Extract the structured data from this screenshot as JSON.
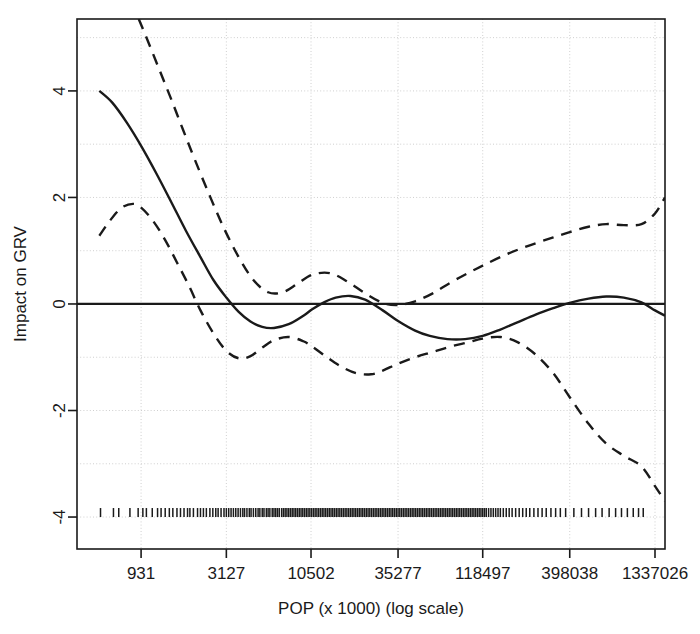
{
  "chart_data": {
    "type": "line",
    "title": "",
    "subtitle": "",
    "xlabel": "POP (x 1000) (log scale)",
    "ylabel": "Impact on GRV",
    "xscale": "log",
    "grid": true,
    "legend": "none",
    "xlim": [
      0,
      1
    ],
    "ylim": [
      -4.6,
      5.35
    ],
    "x_tick_labels": [
      "931",
      "3127",
      "10502",
      "35277",
      "118497",
      "398038",
      "1337026"
    ],
    "x_tick_positions": [
      0.109,
      0.254,
      0.398,
      0.546,
      0.69,
      0.838,
      0.983
    ],
    "y_tick_labels": [
      "4",
      "2",
      "0",
      "-2",
      "-4"
    ],
    "y_tick_values": [
      4,
      2,
      0,
      -2,
      -4
    ],
    "zero_line": 0,
    "series": [
      {
        "name": "fitted smooth",
        "style": "solid",
        "color": "#1a1a1a",
        "x": [
          0.038,
          0.06,
          0.085,
          0.11,
          0.135,
          0.16,
          0.185,
          0.21,
          0.232,
          0.254,
          0.275,
          0.295,
          0.315,
          0.335,
          0.36,
          0.385,
          0.4,
          0.42,
          0.44,
          0.465,
          0.49,
          0.52,
          0.546,
          0.575,
          0.6,
          0.63,
          0.66,
          0.69,
          0.72,
          0.75,
          0.78,
          0.81,
          0.838,
          0.87,
          0.9,
          0.93,
          0.96,
          0.983,
          1.0
        ],
        "y": [
          4.0,
          3.78,
          3.4,
          2.95,
          2.45,
          1.92,
          1.38,
          0.88,
          0.45,
          0.12,
          -0.15,
          -0.33,
          -0.43,
          -0.45,
          -0.38,
          -0.22,
          -0.1,
          0.03,
          0.12,
          0.15,
          0.08,
          -0.12,
          -0.32,
          -0.5,
          -0.6,
          -0.66,
          -0.66,
          -0.6,
          -0.48,
          -0.34,
          -0.2,
          -0.08,
          0.02,
          0.1,
          0.14,
          0.12,
          0.03,
          -0.12,
          -0.22
        ]
      },
      {
        "name": "upper confidence band",
        "style": "dashed",
        "color": "#1a1a1a",
        "x": [
          0.105,
          0.12,
          0.14,
          0.16,
          0.18,
          0.2,
          0.225,
          0.25,
          0.275,
          0.3,
          0.325,
          0.35,
          0.375,
          0.4,
          0.43,
          0.46,
          0.49,
          0.52,
          0.546,
          0.575,
          0.605,
          0.635,
          0.665,
          0.69,
          0.72,
          0.75,
          0.78,
          0.81,
          0.838,
          0.87,
          0.9,
          0.93,
          0.96,
          0.983,
          1.0
        ],
        "y": [
          5.35,
          4.95,
          4.4,
          3.85,
          3.28,
          2.72,
          2.05,
          1.42,
          0.88,
          0.45,
          0.22,
          0.22,
          0.38,
          0.55,
          0.58,
          0.42,
          0.2,
          0.02,
          -0.02,
          0.05,
          0.2,
          0.4,
          0.58,
          0.72,
          0.88,
          1.02,
          1.14,
          1.25,
          1.35,
          1.45,
          1.5,
          1.48,
          1.5,
          1.7,
          2.0
        ]
      },
      {
        "name": "lower confidence band",
        "style": "dashed",
        "color": "#1a1a1a",
        "x": [
          0.038,
          0.055,
          0.075,
          0.095,
          0.11,
          0.13,
          0.15,
          0.17,
          0.19,
          0.21,
          0.232,
          0.254,
          0.275,
          0.295,
          0.315,
          0.335,
          0.36,
          0.385,
          0.4,
          0.425,
          0.45,
          0.475,
          0.5,
          0.52,
          0.546,
          0.575,
          0.605,
          0.635,
          0.665,
          0.69,
          0.72,
          0.75,
          0.78,
          0.81,
          0.838,
          0.87,
          0.9,
          0.93,
          0.96,
          0.983,
          1.0
        ],
        "y": [
          1.28,
          1.55,
          1.8,
          1.88,
          1.8,
          1.55,
          1.2,
          0.78,
          0.35,
          -0.12,
          -0.55,
          -0.88,
          -1.02,
          -0.98,
          -0.82,
          -0.68,
          -0.62,
          -0.7,
          -0.8,
          -1.0,
          -1.18,
          -1.3,
          -1.32,
          -1.25,
          -1.12,
          -1.0,
          -0.9,
          -0.8,
          -0.72,
          -0.65,
          -0.62,
          -0.72,
          -0.95,
          -1.3,
          -1.75,
          -2.25,
          -2.62,
          -2.85,
          -3.05,
          -3.42,
          -3.7
        ]
      }
    ],
    "rug": {
      "name": "data rug ticks",
      "y_value": -4.0,
      "positions": [
        0.04,
        0.062,
        0.071,
        0.09,
        0.104,
        0.112,
        0.118,
        0.128,
        0.137,
        0.143,
        0.15,
        0.157,
        0.163,
        0.17,
        0.176,
        0.182,
        0.188,
        0.192,
        0.198,
        0.205,
        0.21,
        0.215,
        0.22,
        0.226,
        0.231,
        0.236,
        0.24,
        0.245,
        0.25,
        0.254,
        0.258,
        0.262,
        0.266,
        0.27,
        0.274,
        0.278,
        0.282,
        0.285,
        0.289,
        0.293,
        0.296,
        0.3,
        0.304,
        0.308,
        0.311,
        0.315,
        0.318,
        0.322,
        0.325,
        0.328,
        0.332,
        0.335,
        0.338,
        0.341,
        0.344,
        0.348,
        0.351,
        0.354,
        0.357,
        0.36,
        0.363,
        0.366,
        0.369,
        0.372,
        0.375,
        0.378,
        0.381,
        0.384,
        0.387,
        0.39,
        0.393,
        0.396,
        0.399,
        0.402,
        0.405,
        0.408,
        0.411,
        0.414,
        0.417,
        0.42,
        0.423,
        0.426,
        0.429,
        0.432,
        0.435,
        0.438,
        0.441,
        0.444,
        0.447,
        0.45,
        0.453,
        0.456,
        0.459,
        0.462,
        0.465,
        0.468,
        0.471,
        0.474,
        0.477,
        0.48,
        0.483,
        0.486,
        0.489,
        0.492,
        0.495,
        0.498,
        0.501,
        0.504,
        0.507,
        0.51,
        0.513,
        0.516,
        0.519,
        0.522,
        0.525,
        0.528,
        0.531,
        0.534,
        0.537,
        0.54,
        0.543,
        0.546,
        0.549,
        0.552,
        0.555,
        0.558,
        0.561,
        0.564,
        0.567,
        0.57,
        0.573,
        0.576,
        0.579,
        0.582,
        0.585,
        0.588,
        0.591,
        0.594,
        0.597,
        0.6,
        0.603,
        0.606,
        0.609,
        0.612,
        0.615,
        0.618,
        0.621,
        0.624,
        0.627,
        0.63,
        0.633,
        0.636,
        0.639,
        0.642,
        0.645,
        0.648,
        0.651,
        0.654,
        0.657,
        0.66,
        0.663,
        0.666,
        0.669,
        0.672,
        0.675,
        0.678,
        0.681,
        0.684,
        0.687,
        0.69,
        0.693,
        0.696,
        0.7,
        0.704,
        0.708,
        0.712,
        0.716,
        0.72,
        0.725,
        0.73,
        0.735,
        0.74,
        0.746,
        0.752,
        0.758,
        0.764,
        0.77,
        0.777,
        0.784,
        0.791,
        0.798,
        0.806,
        0.814,
        0.822,
        0.831,
        0.845,
        0.858,
        0.87,
        0.882,
        0.893,
        0.905,
        0.916,
        0.926,
        0.936,
        0.946,
        0.955,
        0.963
      ]
    }
  },
  "style": {
    "axis_color": "#1a1a1a",
    "grid_color": "#cfcfcf",
    "line_color": "#1a1a1a",
    "background": "#ffffff"
  }
}
